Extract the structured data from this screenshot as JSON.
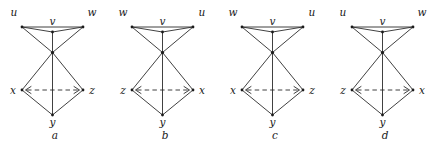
{
  "figure": {
    "panel_count": 4,
    "colors": {
      "edge": "#2b2b2b",
      "node": "#1a1a1a",
      "label": "#1a1a1a",
      "background": "#ffffff"
    },
    "geometry": {
      "panel_width": 110,
      "panel_height": 147,
      "top_left": {
        "x": 22,
        "y": 27
      },
      "top_right": {
        "x": 83,
        "y": 27
      },
      "v_node": {
        "x": 52.5,
        "y": 32
      },
      "center": {
        "x": 52.5,
        "y": 52.5
      },
      "mid_left": {
        "x": 22,
        "y": 90
      },
      "mid_right": {
        "x": 83,
        "y": 90
      },
      "bottom": {
        "x": 52.5,
        "y": 115
      }
    },
    "edges": [
      {
        "from": "top_left",
        "to": "top_right",
        "style": "solid"
      },
      {
        "from": "top_left",
        "to": "v_node",
        "style": "solid"
      },
      {
        "from": "top_right",
        "to": "v_node",
        "style": "solid"
      },
      {
        "from": "v_node",
        "to": "center",
        "style": "solid"
      },
      {
        "from": "top_left",
        "to": "center",
        "style": "solid"
      },
      {
        "from": "top_right",
        "to": "center",
        "style": "solid"
      },
      {
        "from": "center",
        "to": "mid_left",
        "style": "solid"
      },
      {
        "from": "center",
        "to": "mid_right",
        "style": "solid"
      },
      {
        "from": "center",
        "to": "bottom",
        "style": "solid"
      },
      {
        "from": "mid_left",
        "to": "bottom",
        "style": "solid"
      },
      {
        "from": "mid_right",
        "to": "bottom",
        "style": "solid"
      },
      {
        "from": "mid_left",
        "to": "mid_right",
        "style": "dashed"
      }
    ],
    "panels": [
      {
        "caption": "a",
        "labels": {
          "top_left": "u",
          "top_right": "w",
          "v": "v",
          "mid_left": "x",
          "mid_right": "z",
          "bottom": "y"
        }
      },
      {
        "caption": "b",
        "labels": {
          "top_left": "w",
          "top_right": "u",
          "v": "v",
          "mid_left": "z",
          "mid_right": "x",
          "bottom": "y"
        }
      },
      {
        "caption": "c",
        "labels": {
          "top_left": "w",
          "top_right": "u",
          "v": "v",
          "mid_left": "x",
          "mid_right": "z",
          "bottom": "y"
        }
      },
      {
        "caption": "d",
        "labels": {
          "top_left": "u",
          "top_right": "w",
          "v": "v",
          "mid_left": "z",
          "mid_right": "x",
          "bottom": "y"
        }
      }
    ]
  }
}
